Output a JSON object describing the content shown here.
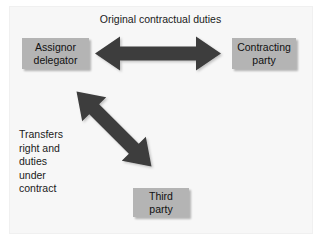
{
  "figure": {
    "title": "Original contractual duties",
    "background_color": "#f7f7f7",
    "arrow_color": "#3d3d3d",
    "box_fill_color": "#b4b4b4",
    "text_color": "#1a1a1a"
  },
  "nodes": [
    {
      "id": "assignor-delegator",
      "lines": [
        "Assignor",
        "delegator"
      ]
    },
    {
      "id": "contracting-party",
      "lines": [
        "Contracting",
        "party"
      ]
    },
    {
      "id": "third-party",
      "lines": [
        "Third",
        "party"
      ]
    }
  ],
  "connectors": [
    {
      "id": "horizontal-double-arrow",
      "label": "Original contractual duties",
      "from": "assignor-delegator",
      "to": "contracting-party",
      "style": "double-headed"
    },
    {
      "id": "diagonal-double-arrow",
      "label": "Transfers right and duties under contract",
      "from": "assignor-delegator",
      "to": "third-party",
      "style": "double-headed"
    }
  ],
  "captions": {
    "transfer": {
      "lines": [
        "Transfers",
        "right and",
        "duties",
        "under",
        "contract"
      ]
    }
  }
}
